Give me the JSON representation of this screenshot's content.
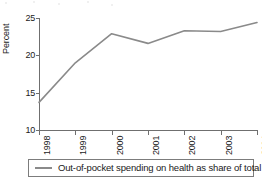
{
  "chart_data": {
    "type": "line",
    "title": "",
    "subtitle": "",
    "xlabel": "",
    "ylabel": "Percent",
    "categories": [
      "1998",
      "1999",
      "2000",
      "2001",
      "2002",
      "2003",
      "2004"
    ],
    "x": [
      1998,
      1999,
      2000,
      2001,
      2002,
      2003,
      2004
    ],
    "series": [
      {
        "name": "Out-of-pocket spending on health as share of total",
        "color": "#8a8a8a",
        "values": [
          13.7,
          19.0,
          22.9,
          21.6,
          23.3,
          23.2,
          24.4
        ]
      }
    ],
    "ylim": [
      10,
      25
    ],
    "xlim": [
      1998,
      2004
    ],
    "y_ticks": [
      10,
      15,
      20,
      25
    ],
    "y_tick_labels": [
      "10",
      "15",
      "20",
      "25"
    ],
    "x_tick_labels": [
      "1998",
      "1999",
      "2000",
      "2001",
      "2002",
      "2003",
      "2004"
    ],
    "x_tick_label_rotation": "-90",
    "grid": false,
    "legend_position": "bottom",
    "legend_entries": [
      "Out-of-pocket spending on health as share of total"
    ]
  },
  "axes": {
    "y_title": "Percent",
    "y_ticks": [
      "25",
      "20",
      "15",
      "10"
    ],
    "x_ticks": [
      "1998",
      "1999",
      "2000",
      "2001",
      "2002",
      "2003",
      "2004"
    ]
  },
  "legend": {
    "label": "Out-of-pocket spending on health as share of total"
  },
  "colors": {
    "line": "#8a8a8a",
    "axis": "#6f6f6f",
    "text": "#1a1a1a",
    "legend_border": "#7c7c7c",
    "background": "#ffffff"
  }
}
